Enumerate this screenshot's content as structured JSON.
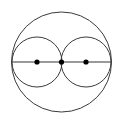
{
  "figure": {
    "background_color": "#ffffff",
    "stroke_color": "#3a3a3a",
    "axis_color": "#9a9a9a",
    "point_color": "#000000",
    "canvas": {
      "width": 123,
      "height": 124
    }
  },
  "chart_data": {
    "type": "scatter",
    "xlabel": "",
    "ylabel": "",
    "xlim": [
      0,
      123
    ],
    "ylim": [
      0,
      124
    ],
    "grid": false,
    "legend": "none",
    "circles": [
      {
        "name": "outer-circle",
        "cx": 61.5,
        "cy": 62,
        "r": 50,
        "stroke": "#3a3a3a",
        "stroke_width": 1,
        "fill": "none"
      },
      {
        "name": "left-inner-circle",
        "cx": 37,
        "cy": 62,
        "r": 25,
        "stroke": "#3a3a3a",
        "stroke_width": 1,
        "fill": "none"
      },
      {
        "name": "right-inner-circle",
        "cx": 86,
        "cy": 62,
        "r": 25,
        "stroke": "#3a3a3a",
        "stroke_width": 1,
        "fill": "none"
      }
    ],
    "lines": [
      {
        "name": "horizontal-diameter",
        "x1": 12,
        "y1": 62,
        "x2": 111,
        "y2": 62,
        "stroke": "#9a9a9a",
        "stroke_width": 2
      }
    ],
    "points": [
      {
        "name": "left-center-point",
        "x": 37,
        "y": 62,
        "r": 2.6,
        "fill": "#000000"
      },
      {
        "name": "middle-center-point",
        "x": 61.5,
        "y": 62,
        "r": 2.6,
        "fill": "#000000"
      },
      {
        "name": "right-center-point",
        "x": 86,
        "y": 62,
        "r": 2.6,
        "fill": "#000000"
      }
    ]
  }
}
